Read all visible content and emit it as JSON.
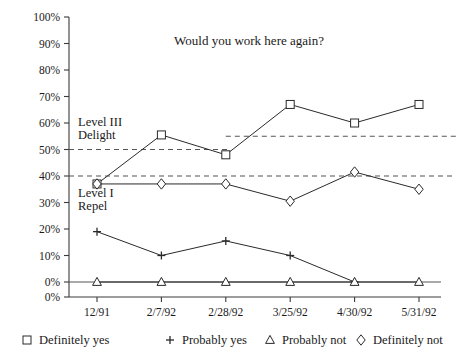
{
  "chart_data": {
    "type": "line",
    "title": "Would you work here again?",
    "xlabel": "",
    "ylabel": "",
    "categories": [
      "12/91",
      "2/7/92",
      "2/28/92",
      "3/25/92",
      "4/30/92",
      "5/31/92"
    ],
    "ylim": [
      0,
      100
    ],
    "ytick_labels": [
      "100%",
      "90%",
      "80%",
      "70%",
      "60%",
      "50%",
      "40%",
      "30%",
      "20%",
      "10%",
      "0%",
      "0%"
    ],
    "ytick_values": [
      100,
      90,
      80,
      70,
      60,
      50,
      40,
      30,
      20,
      10,
      0,
      -10
    ],
    "grid": false,
    "legend_position": "bottom",
    "series": [
      {
        "name": "Definitely yes",
        "marker": "square",
        "values": [
          37,
          55.5,
          48,
          67,
          60,
          67
        ]
      },
      {
        "name": "Probably yes",
        "marker": "plus",
        "values": [
          19,
          10,
          15.5,
          10,
          0,
          null
        ]
      },
      {
        "name": "Probably not",
        "marker": "triangle",
        "values": [
          0,
          0,
          0,
          0,
          0,
          0
        ]
      },
      {
        "name": "Definitely not",
        "marker": "diamond",
        "values": [
          37,
          37,
          37,
          30.5,
          41.5,
          35
        ]
      }
    ],
    "annotations": [
      {
        "text": "Level III",
        "value": 60.5,
        "x_index": 0
      },
      {
        "text": "Delight",
        "value": 55.5,
        "x_index": 0
      },
      {
        "text": "Level I",
        "value": 33.5,
        "x_index": 0
      },
      {
        "text": "Repel",
        "value": 28.5,
        "x_index": 0
      }
    ],
    "reference_lines": [
      {
        "label": "Level III lower bound (early)",
        "value": 50,
        "x_start_index": 0,
        "x_end_index": 2.05,
        "style": "dashed"
      },
      {
        "label": "Level III lower bound (later)",
        "value": 55,
        "x_start_index": 2.0,
        "x_end_index": 5.6,
        "style": "dashed"
      },
      {
        "label": "Level I upper bound",
        "value": 40,
        "x_start_index": 0,
        "x_end_index": 5.6,
        "style": "dashed"
      }
    ]
  },
  "legend": {
    "items": [
      {
        "marker_name": "square-marker-icon",
        "label": "Definitely yes"
      },
      {
        "marker_name": "plus-marker-icon",
        "label": "Probably yes"
      },
      {
        "marker_name": "triangle-marker-icon",
        "label": "Probably not"
      },
      {
        "marker_name": "diamond-marker-icon",
        "label": "Definitely not"
      }
    ]
  },
  "colors": {
    "axis": "#3a3a3a",
    "series_stroke": "#2a2a2a",
    "reference_dash": "#555555",
    "marker_fill": "#ffffff",
    "text": "#1a1a1a",
    "background": "#ffffff"
  }
}
